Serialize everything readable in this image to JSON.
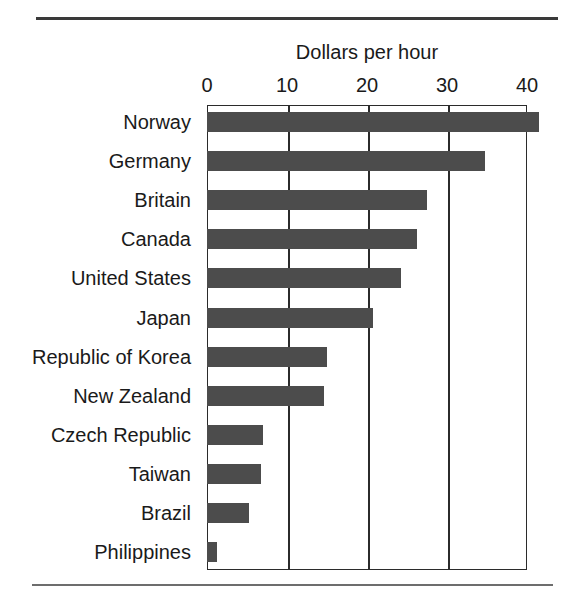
{
  "chart_data": {
    "type": "bar",
    "orientation": "horizontal",
    "title": "Dollars per hour",
    "xlabel": "",
    "ylabel": "",
    "xlim": [
      0,
      40
    ],
    "xticks": [
      0,
      10,
      20,
      30,
      40
    ],
    "xtick_labels": [
      "0",
      "10",
      "20",
      "30",
      "40"
    ],
    "grid": true,
    "legend": false,
    "bar_color": "#4c4c4c",
    "frame_color": "#2b2b2b",
    "categories": [
      "Norway",
      "Germany",
      "Britain",
      "Canada",
      "United States",
      "Japan",
      "Republic of Korea",
      "New Zealand",
      "Czech Republic",
      "Taiwan",
      "Brazil",
      "Philippines"
    ],
    "values": [
      41.5,
      34.8,
      27.5,
      26.2,
      24.2,
      20.7,
      15.0,
      14.6,
      7.0,
      6.8,
      5.3,
      1.2
    ]
  },
  "rules": {
    "top": "top-divider-rule",
    "bottom": "bottom-divider-rule"
  }
}
